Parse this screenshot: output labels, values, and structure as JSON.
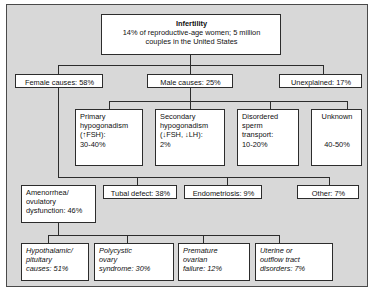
{
  "diagram": {
    "panel_bg": "#d8d8d8",
    "box_bg": "#ffffff",
    "line_color": "#2c2c2c"
  },
  "root": {
    "heading": "Infertility",
    "line1": "14% of reproductive-age women; 5 million",
    "line2": "couples in the United States"
  },
  "level1": [
    {
      "label": "Female causes: 58%"
    },
    {
      "label": "Male causes: 25%"
    },
    {
      "label": "Unexplained: 17%"
    }
  ],
  "male_children": [
    {
      "l1": "Primary",
      "l2": "hypogonadism",
      "l3": "(↑FSH):",
      "l4": "30-40%"
    },
    {
      "l1": "Secondary",
      "l2": "hypogonadism",
      "l3": "(↓FSH, ↓LH):",
      "l4": "2%"
    },
    {
      "l1": "Disordered",
      "l2": "sperm",
      "l3": "transport:",
      "l4": "10-20%"
    },
    {
      "l1": "Unknown",
      "l2": "",
      "l3": "",
      "l4": "40-50%"
    }
  ],
  "female_children": [
    {
      "l1": "Amenorrhea/",
      "l2": "ovulatory",
      "l3": "dysfunction: 46%"
    },
    {
      "l1": "Tubal defect: 38%",
      "l2": "",
      "l3": ""
    },
    {
      "l1": "Endometriosis: 9%",
      "l2": "",
      "l3": ""
    },
    {
      "l1": "Other: 7%",
      "l2": "",
      "l3": ""
    }
  ],
  "amenorrhea_children": [
    {
      "l1": "Hypothalamic/",
      "l2": "pituitary",
      "l3": "causes: 51%"
    },
    {
      "l1": "Polycystic",
      "l2": "ovary",
      "l3": "syndrome: 30%"
    },
    {
      "l1": "Premature",
      "l2": "ovarian",
      "l3": "failure: 12%"
    },
    {
      "l1": "Uterine or",
      "l2": "outflow tract",
      "l3": "disorders: 7%"
    }
  ]
}
